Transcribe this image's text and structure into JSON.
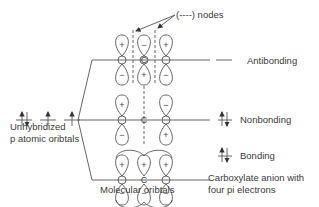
{
  "nodes_label": "(----) nodes",
  "left": {
    "label_line1": "Unhybridized",
    "label_line2": "p atomic oribtals",
    "electrons": [
      "up-down",
      "up",
      "up"
    ]
  },
  "center": {
    "label": "Molecular oribtals",
    "atoms": [
      "O",
      "C",
      "O"
    ],
    "levels": [
      {
        "name": "Antibonding",
        "top_phases": [
          "+",
          "-",
          "+"
        ],
        "bottom_phases": [
          "-",
          "+",
          "-"
        ],
        "nodes": 2
      },
      {
        "name": "Nonbonding",
        "top_phases": [
          "+",
          "",
          "-"
        ],
        "bottom_phases": [
          "-",
          "",
          "+"
        ],
        "nodes": 1
      },
      {
        "name": "Bonding",
        "top_phases": [
          "+",
          "+",
          "+"
        ],
        "bottom_phases": [
          "-",
          "-",
          "-"
        ],
        "nodes": 0
      }
    ]
  },
  "right": {
    "antibonding": "Antibonding",
    "nonbonding": "Nonbonding",
    "bonding": "Bonding",
    "caption_line1": "Carboxylate anion with",
    "caption_line2": "four pi electrons"
  }
}
